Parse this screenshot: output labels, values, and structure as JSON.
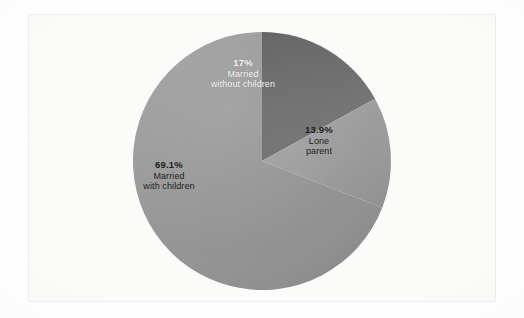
{
  "figure": {
    "background_color": "#ffffff",
    "panel_color": "#fbfbfa",
    "panel_border_color": "#f0efee"
  },
  "chart_data": {
    "type": "pie",
    "title": "",
    "subtitle": "",
    "xlabel": "",
    "ylabel": "",
    "legend_position": "none",
    "labels_inside_slices": true,
    "start_angle_deg": 0,
    "direction": "clockwise",
    "center": {
      "x": 262,
      "y": 161
    },
    "radius": 129,
    "categories": [
      "Married without children",
      "Lone parent",
      "Married with children"
    ],
    "values": [
      17,
      13.9,
      69.1
    ],
    "value_labels": [
      "17%",
      "13.9%",
      "69.1%"
    ],
    "colors": [
      "#6e6e6e",
      "#9c9c9c",
      "#979797"
    ],
    "slices": [
      {
        "name": "married-without-children",
        "percent_label": "17%",
        "value": 17,
        "label_line_1": "Married",
        "label_line_2": "without children",
        "color": "#6e6e6e",
        "text_color": "#ffffff",
        "start_deg": 0,
        "end_deg": 61.2
      },
      {
        "name": "lone-parent",
        "percent_label": "13.9%",
        "value": 13.9,
        "label_line_1": "Lone",
        "label_line_2": "parent",
        "color": "#9c9c9c",
        "text_color": "#1d1d1d",
        "start_deg": 61.2,
        "end_deg": 111.24
      },
      {
        "name": "married-with-children",
        "percent_label": "69.1%",
        "value": 69.1,
        "label_line_1": "Married",
        "label_line_2": "with children",
        "color": "#979797",
        "text_color": "#1d1d1d",
        "start_deg": 111.24,
        "end_deg": 360
      }
    ]
  }
}
